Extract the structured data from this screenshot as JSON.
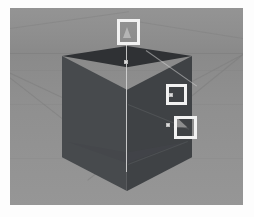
{
  "scene": {
    "title": "3D Viewport",
    "background_color": "#8d8d8d",
    "ground_color": "#8f8f8f",
    "horizon_color": "#7e7e7e",
    "highlight_color": "#f2f2f2"
  },
  "object": {
    "name": "cube",
    "top_face_color": "#2f3134",
    "left_face_color": "#474a4d",
    "right_face_color": "#3f4245",
    "edge_color": "#6e7174"
  },
  "gizmo": {
    "name": "transform-gizmo",
    "axis_color": "#d9d9d9",
    "handles": [
      {
        "name": "y-axis-cone-handle",
        "label": ""
      },
      {
        "name": "center-square-handle",
        "label": ""
      },
      {
        "name": "plane-square-handle",
        "label": ""
      },
      {
        "name": "diagonal-arrow-handle",
        "label": ""
      }
    ]
  },
  "annotations": [
    {
      "name": "annotation-box-top",
      "target": "y-axis-cone-handle",
      "x": 107,
      "y": 11,
      "w": 23,
      "h": 26,
      "label": ""
    },
    {
      "name": "annotation-box-middle",
      "target": "plane-square-handle",
      "x": 156,
      "y": 76,
      "w": 21,
      "h": 21,
      "label": ""
    },
    {
      "name": "annotation-box-bottom",
      "target": "diagonal-arrow-handle",
      "x": 164,
      "y": 108,
      "w": 23,
      "h": 23,
      "label": ""
    }
  ]
}
